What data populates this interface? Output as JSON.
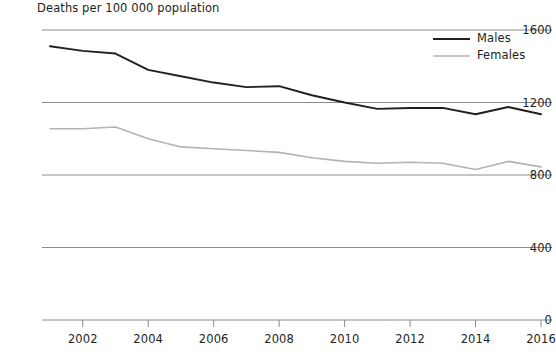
{
  "chart_data": {
    "type": "line",
    "title": "Deaths per 100 000 population",
    "xlabel": "",
    "ylabel": "Deaths per 100 000 population",
    "xlim": [
      2001,
      2016
    ],
    "ylim": [
      0,
      1600
    ],
    "grid": true,
    "legend_position": "top-right",
    "y_ticks": [
      0,
      400,
      800,
      1200,
      1600
    ],
    "y_tick_labels": [
      "0",
      "400",
      "800",
      "1200",
      "1600"
    ],
    "x_ticks": [
      2002,
      2004,
      2006,
      2008,
      2010,
      2012,
      2014,
      2016
    ],
    "x_tick_labels": [
      "2002",
      "2004",
      "2006",
      "2008",
      "2010",
      "2012",
      "2014",
      "2016"
    ],
    "x": [
      2001,
      2002,
      2003,
      2004,
      2005,
      2006,
      2007,
      2008,
      2009,
      2010,
      2011,
      2012,
      2013,
      2014,
      2015,
      2016
    ],
    "series": [
      {
        "name": "Males",
        "color": "#231f20",
        "values": [
          1510,
          1485,
          1470,
          1380,
          1345,
          1310,
          1285,
          1290,
          1240,
          1200,
          1165,
          1170,
          1170,
          1135,
          1175,
          1135
        ]
      },
      {
        "name": "Females",
        "color": "#b3b3b3",
        "values": [
          1055,
          1055,
          1065,
          1000,
          955,
          945,
          935,
          925,
          895,
          875,
          865,
          870,
          865,
          830,
          875,
          845
        ]
      }
    ]
  },
  "legend": {
    "entries": [
      {
        "label": "Males"
      },
      {
        "label": "Females"
      }
    ]
  },
  "colors": {
    "males": "#231f20",
    "females": "#b3b3b3",
    "gridline": "#8c8c8c",
    "axis": "#8c8c8c",
    "text": "#231f20",
    "background": "#ffffff"
  }
}
